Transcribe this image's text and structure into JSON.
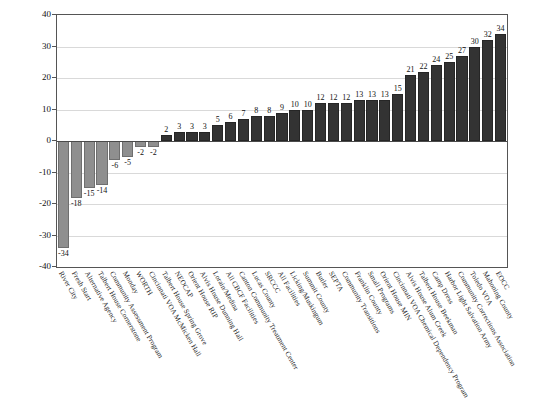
{
  "chart_data": {
    "type": "bar",
    "title": "",
    "xlabel": "",
    "ylabel": "Probability of Reincarceration",
    "ylim": [
      -40,
      40
    ],
    "ytick_labels": [
      "40",
      "30",
      "20",
      "10",
      "0",
      "-10",
      "-20",
      "-30",
      "-40"
    ],
    "ytick_values": [
      40,
      30,
      20,
      10,
      0,
      -10,
      -20,
      -30,
      -40
    ],
    "grid": true,
    "legend": "none",
    "colors": {
      "negative_bar": "#8f8f8f",
      "positive_bar": "#333333",
      "gridline": "#d9d9d9",
      "axis": "#555555"
    },
    "categories": [
      "River City",
      "Fresh Start",
      "Alternative Agency",
      "Talbert House Cornerstone",
      "Community Assessment Program",
      "Monday",
      "WORTH",
      "Cincinnati VOA McMicken Hall",
      "Talbert House Spring Grove",
      "NEOCAP",
      "Orient House RIP",
      "Alvis House Dunning Hall",
      "Lorain/Medina",
      "All CBCF Facilities",
      "Canton Community Treatment Center",
      "Lucas County",
      "SRCCC",
      "All Facilities",
      "Licking/Muskingum",
      "Summit County",
      "Butler",
      "SEPTA",
      "Community Transitions",
      "Franklin County",
      "Small Programs",
      "Orient House MIN",
      "Cincinnati VOA Chemical Dependency Program",
      "Alvis House Alum Creek",
      "Talbert House Beekman",
      "Camp Dress",
      "Harbor Light Salvation Army",
      "Community Corrections Association",
      "Toledo VOA",
      "Mahoning County",
      "EOCC"
    ],
    "values": [
      -34,
      -18,
      -15,
      -14,
      -6,
      -5,
      -2,
      -2,
      2,
      3,
      3,
      3,
      5,
      6,
      7,
      8,
      8,
      9,
      10,
      10,
      12,
      12,
      12,
      13,
      13,
      13,
      15,
      21,
      22,
      24,
      25,
      27,
      30,
      32,
      34
    ],
    "value_labels": [
      "-34",
      "-18",
      "-15",
      "-14",
      "-6",
      "-5",
      "-2",
      "-2",
      "2",
      "3",
      "3",
      "3",
      "5",
      "6",
      "7",
      "8",
      "8",
      "9",
      "10",
      "10",
      "12",
      "12",
      "12",
      "13",
      "13",
      "13",
      "15",
      "21",
      "22",
      "24",
      "25",
      "27",
      "30",
      "32",
      "34"
    ]
  }
}
